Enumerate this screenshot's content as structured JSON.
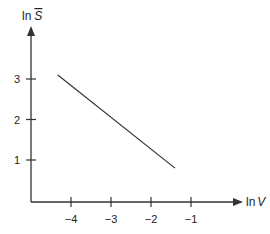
{
  "chart_data": {
    "type": "line",
    "title": "",
    "xlabel": "ln V",
    "ylabel": "ln S̄",
    "xlabel_parts": {
      "prefix": "ln",
      "var": "V"
    },
    "ylabel_parts": {
      "prefix": "ln",
      "var": "S"
    },
    "x_ticks": [
      -4,
      -3,
      -2,
      -1
    ],
    "x_tick_labels": [
      "−4",
      "−3",
      "−2",
      "−1"
    ],
    "y_ticks": [
      1,
      2,
      3
    ],
    "y_tick_labels": [
      "1",
      "2",
      "3"
    ],
    "xlim": [
      -5.0,
      -0.4
    ],
    "ylim": [
      0,
      3.6
    ],
    "grid": false,
    "legend": null,
    "series": [
      {
        "name": "ln S vs ln V",
        "x": [
          -4.33,
          -1.4
        ],
        "y": [
          3.1,
          0.8
        ],
        "color": "#333333"
      }
    ]
  },
  "colors": {
    "axis": "#333333",
    "line": "#333333",
    "background": "#ffffff"
  }
}
